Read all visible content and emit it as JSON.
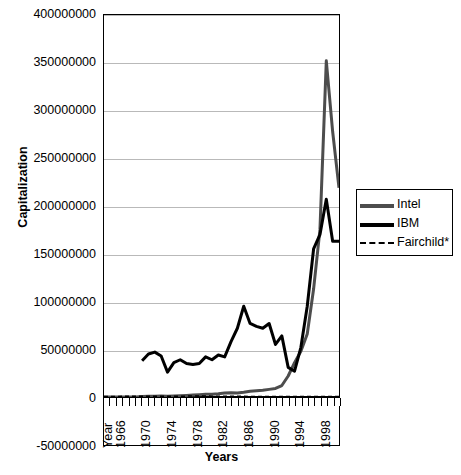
{
  "chart_data": {
    "type": "line",
    "title": "",
    "xlabel": "Years",
    "ylabel": "Capitalization",
    "ylim": [
      -50000000,
      400000000
    ],
    "ytick_labels": [
      "400000000",
      "350000000",
      "300000000",
      "250000000",
      "200000000",
      "150000000",
      "100000000",
      "50000000",
      "0",
      "-50000000"
    ],
    "ytick_values": [
      400000000,
      350000000,
      300000000,
      250000000,
      200000000,
      150000000,
      100000000,
      50000000,
      0,
      -50000000
    ],
    "xtick_labels": [
      "Year",
      "1966",
      "1970",
      "1974",
      "1978",
      "1982",
      "1986",
      "1990",
      "1994",
      "1998"
    ],
    "xlim": [
      1964,
      2001
    ],
    "grid": true,
    "legend_position": "right",
    "x": [
      1964,
      1965,
      1966,
      1967,
      1968,
      1969,
      1970,
      1971,
      1972,
      1973,
      1974,
      1975,
      1976,
      1977,
      1978,
      1979,
      1980,
      1981,
      1982,
      1983,
      1984,
      1985,
      1986,
      1987,
      1988,
      1989,
      1990,
      1991,
      1992,
      1993,
      1994,
      1995,
      1996,
      1997,
      1998,
      1999,
      2000,
      2001
    ],
    "series": [
      {
        "name": "Intel",
        "color": "#4d4d4d",
        "style": "solid",
        "width": 3,
        "values": [
          0,
          0,
          0,
          0,
          0,
          0,
          600000,
          700000,
          900000,
          1000000,
          900000,
          1100000,
          1400000,
          1700000,
          2000000,
          2400000,
          2800000,
          3000000,
          3400000,
          4200000,
          4500000,
          4300000,
          5000000,
          6000000,
          6500000,
          7000000,
          8000000,
          9000000,
          12000000,
          22000000,
          36000000,
          48000000,
          66000000,
          113000000,
          175000000,
          352000000,
          278000000,
          219000000
        ]
      },
      {
        "name": "IBM",
        "color": "#000000",
        "style": "solid",
        "width": 3,
        "values": [
          null,
          null,
          null,
          null,
          null,
          null,
          38000000,
          45000000,
          47000000,
          43000000,
          26000000,
          36000000,
          39000000,
          35000000,
          34000000,
          35000000,
          42000000,
          39000000,
          44000000,
          42000000,
          58000000,
          72000000,
          95000000,
          77000000,
          74000000,
          72000000,
          77000000,
          55000000,
          64000000,
          31000000,
          27000000,
          52000000,
          95000000,
          155000000,
          170000000,
          207000000,
          163000000,
          163000000
        ]
      },
      {
        "name": "Fairchild*",
        "color": "#000000",
        "style": "dashed",
        "width": 1.5,
        "values": [
          400000,
          500000,
          600000,
          700000,
          800000,
          900000,
          800000,
          700000,
          700000,
          800000,
          700000,
          800000,
          900000,
          900000,
          1000000,
          1000000,
          1000000,
          900000,
          900000,
          800000,
          800000,
          700000,
          700000,
          600000,
          600000,
          500000,
          500000,
          500000,
          400000,
          400000,
          400000,
          400000,
          400000,
          400000,
          400000,
          400000,
          400000,
          400000
        ]
      }
    ]
  },
  "legend": {
    "items": [
      {
        "label": "Intel"
      },
      {
        "label": "IBM"
      },
      {
        "label": "Fairchild*"
      }
    ]
  }
}
